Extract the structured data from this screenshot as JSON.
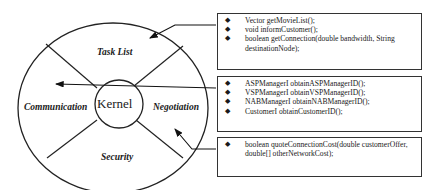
{
  "diagram": {
    "center": {
      "label": "Kernel"
    },
    "segments": {
      "top": "Task List",
      "left": "Communication",
      "right": "Negotiation",
      "bottom": "Security"
    }
  },
  "boxes": [
    {
      "name": "task-list-methods",
      "items": [
        "Vector getMovieList();",
        "void informCustomer();",
        "boolean getConnection(double bandwidth, String destinationNode);"
      ]
    },
    {
      "name": "communication-methods",
      "items": [
        "ASPManagerI obtainASPManagerID();",
        "VSPManagerI obtainVSPManagerID();",
        "NABManagerI obtainNABManagerID();",
        "CustomerI obtainCustomerID();"
      ]
    },
    {
      "name": "negotiation-methods",
      "items": [
        "boolean quoteConnectionCost(double customerOffer, double[] otherNetworkCost);"
      ]
    }
  ],
  "bullet": "◆",
  "colors": {
    "stroke": "#222222",
    "background": "#ffffff"
  }
}
